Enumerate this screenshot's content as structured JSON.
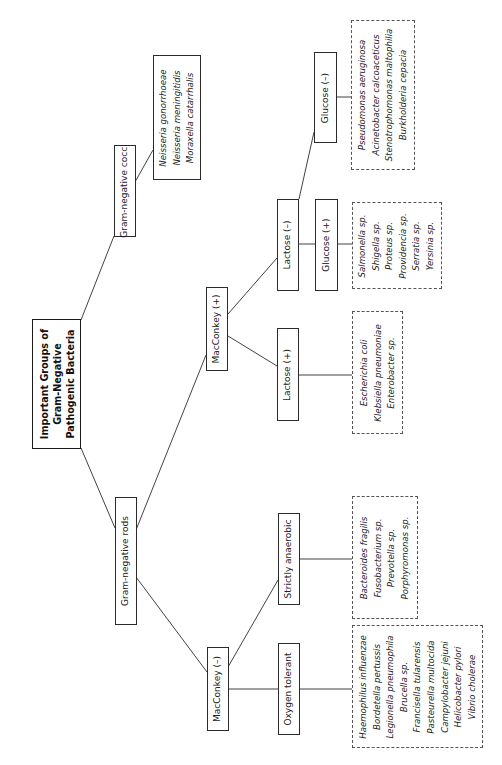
{
  "diagram": {
    "title": [
      "Important Groups of",
      "Gram-Negative",
      "Pathogenic Bacteria"
    ],
    "colors": {
      "line": "#2b2b2b",
      "dashed_border": "#555555",
      "text": "#222222",
      "background": "#ffffff"
    },
    "nodes": {
      "root": {
        "label": [
          "Important Groups of",
          "Gram-Negative",
          "Pathogenic Bacteria"
        ]
      },
      "gram_negative_cocci": {
        "label": "Gram-negative cocci"
      },
      "cocci_species": {
        "species": [
          "Neisseria gonorrhoeae",
          "Neisseria meningitidis",
          "Moraxella catarrhalis"
        ]
      },
      "gram_negative_rods": {
        "label": "Gram-negative rods"
      },
      "macconkey_positive": {
        "label": "MacConkey (+)"
      },
      "macconkey_negative": {
        "label": "MacConkey (–)"
      },
      "lactose_negative": {
        "label": "Lactose (–)"
      },
      "lactose_positive": {
        "label": "Lactose (+)"
      },
      "glucose_negative": {
        "label": "Glucose (–)"
      },
      "glucose_positive": {
        "label": "Glucose (+)"
      },
      "glucose_negative_species": {
        "species": [
          "Pseudomonas aeruginosa",
          "Acinetobacter calcoaceticus",
          "Stenotrophomonas maltophilia",
          "Burkholderia cepacia"
        ]
      },
      "glucose_positive_species": {
        "species": [
          "Salmonella sp.",
          "Shigella sp.",
          "Proteus sp.",
          "Providencia sp.",
          "Serratia sp.",
          "Yersinia sp."
        ]
      },
      "lactose_positive_species": {
        "species": [
          "Escherichia coli",
          "Klebsiella pneumoniae",
          "Enterobacter sp."
        ]
      },
      "strictly_anaerobic": {
        "label": "Strictly anaerobic"
      },
      "oxygen_tolerant": {
        "label": "Oxygen tolerant"
      },
      "anaerobic_species": {
        "species": [
          "Bacteroides fragilis",
          "Fusobacterium sp.",
          "Prevotella sp.",
          "Porphyromonas sp."
        ]
      },
      "oxygen_tolerant_species": {
        "species": [
          "Haemophilus influenzae",
          "Bordetella pertussis",
          "Legionella pneumophila",
          "Brucella sp.",
          "Francisella tularensis",
          "Pasteurella multocida",
          "Campylobacter jejuni",
          "Helicobacter pylori",
          "Vibrio cholerae"
        ]
      }
    },
    "edges": [
      [
        "root",
        "gram_negative_cocci"
      ],
      [
        "root",
        "gram_negative_rods"
      ],
      [
        "gram_negative_cocci",
        "cocci_species"
      ],
      [
        "gram_negative_rods",
        "macconkey_positive"
      ],
      [
        "gram_negative_rods",
        "macconkey_negative"
      ],
      [
        "macconkey_positive",
        "lactose_negative"
      ],
      [
        "macconkey_positive",
        "lactose_positive"
      ],
      [
        "lactose_negative",
        "glucose_negative"
      ],
      [
        "lactose_negative",
        "glucose_positive"
      ],
      [
        "glucose_negative",
        "glucose_negative_species"
      ],
      [
        "glucose_positive",
        "glucose_positive_species"
      ],
      [
        "lactose_positive",
        "lactose_positive_species"
      ],
      [
        "macconkey_negative",
        "strictly_anaerobic"
      ],
      [
        "macconkey_negative",
        "oxygen_tolerant"
      ],
      [
        "strictly_anaerobic",
        "anaerobic_species"
      ],
      [
        "oxygen_tolerant",
        "oxygen_tolerant_species"
      ]
    ]
  }
}
